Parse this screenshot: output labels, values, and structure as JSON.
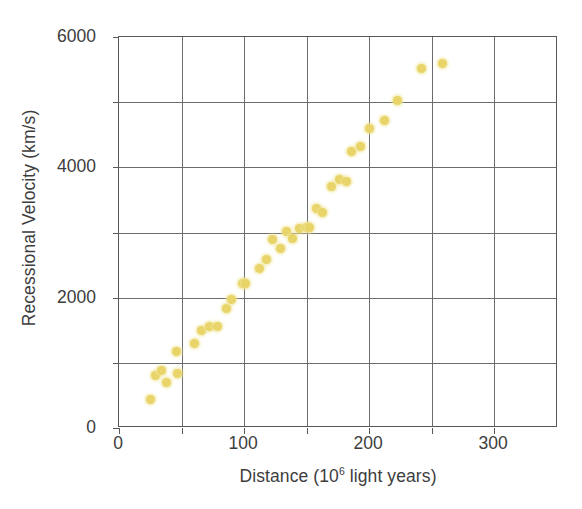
{
  "chart_data": {
    "type": "scatter",
    "title": "",
    "subtitle": "",
    "xlabel_prefix": "Distance (10",
    "xlabel_sup": "6",
    "xlabel_suffix": " light years)",
    "xlabel_full": "Distance (10^6 light years)",
    "ylabel": "Recessional Velocity (km/s)",
    "xlim": [
      0,
      351
    ],
    "ylim": [
      0,
      6000
    ],
    "xticks_major": [
      0,
      100,
      200,
      300
    ],
    "xticks_all": [
      0,
      50,
      100,
      150,
      200,
      250,
      300
    ],
    "xticklabels": [
      "0",
      "100",
      "200",
      "300"
    ],
    "yticks_major": [
      0,
      2000,
      4000,
      6000
    ],
    "yticks_all": [
      0,
      1000,
      2000,
      3000,
      4000,
      5000,
      6000
    ],
    "yticklabels": [
      "0",
      "2000",
      "4000",
      "6000"
    ],
    "grid": true,
    "grid_x_at": [
      50,
      100,
      150,
      200,
      250,
      300
    ],
    "grid_y_at": [
      1000,
      2000,
      3000,
      4000,
      5000
    ],
    "legend": null,
    "point_color": "#e8d469",
    "point_glow_color": "#f0e496",
    "axis_color": "#57585a",
    "grid_color": "#6b6c6e",
    "text_color": "#3d3d3d",
    "background": "#ffffff",
    "series": [
      {
        "name": "galaxies",
        "points": [
          [
            25,
            430
          ],
          [
            29,
            800
          ],
          [
            34,
            880
          ],
          [
            38,
            700
          ],
          [
            46,
            1180
          ],
          [
            47,
            830
          ],
          [
            60,
            1290
          ],
          [
            66,
            1490
          ],
          [
            72,
            1560
          ],
          [
            79,
            1560
          ],
          [
            86,
            1840
          ],
          [
            90,
            1970
          ],
          [
            99,
            2210
          ],
          [
            101,
            2220
          ],
          [
            112,
            2450
          ],
          [
            118,
            2580
          ],
          [
            123,
            2890
          ],
          [
            129,
            2750
          ],
          [
            134,
            3020
          ],
          [
            139,
            2910
          ],
          [
            144,
            3060
          ],
          [
            150,
            3070
          ],
          [
            152,
            3080
          ],
          [
            158,
            3370
          ],
          [
            163,
            3300
          ],
          [
            170,
            3700
          ],
          [
            176,
            3810
          ],
          [
            182,
            3790
          ],
          [
            186,
            4250
          ],
          [
            193,
            4320
          ],
          [
            200,
            4600
          ],
          [
            212,
            4720
          ],
          [
            223,
            5030
          ],
          [
            242,
            5520
          ],
          [
            259,
            5600
          ]
        ]
      }
    ]
  }
}
